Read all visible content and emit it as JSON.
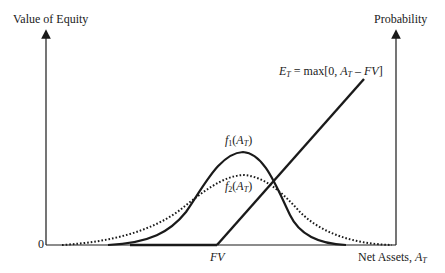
{
  "diagram": {
    "left_axis_label": "Value of Equity",
    "right_axis_label": "Probability",
    "x_axis_label": "Net Assets, ",
    "x_axis_label_var": "A",
    "x_axis_label_sub": "T",
    "origin_label": "0",
    "fv_label": "FV",
    "payoff_label": {
      "lhs": "E",
      "lhs_sub": "T",
      "eq": " = max[0, ",
      "var": "A",
      "var_sub": "T",
      "rest": " – ",
      "fv": "FV",
      "close": "]"
    },
    "f1_label": {
      "f": "f",
      "sub": "1",
      "open": "(",
      "var": "A",
      "var_sub": "T",
      "close": ")"
    },
    "f2_label": {
      "f": "f",
      "sub": "2",
      "open": "(",
      "var": "A",
      "var_sub": "T",
      "close": ")"
    },
    "colors": {
      "line": "#1a1a1a",
      "background": "#ffffff"
    }
  }
}
